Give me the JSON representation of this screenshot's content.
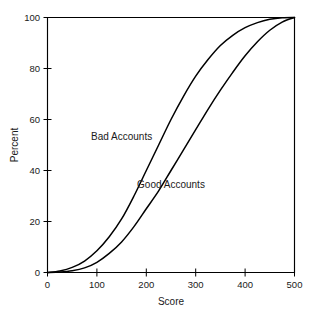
{
  "chart_data": {
    "type": "line",
    "title": "",
    "subtitle": "",
    "xlabel": "Score",
    "ylabel": "Percent",
    "xlim": [
      0,
      500
    ],
    "ylim": [
      0,
      100
    ],
    "xticks": [
      0,
      100,
      200,
      300,
      400,
      500
    ],
    "xtick_labels": [
      "0",
      "100",
      "200",
      "300",
      "400",
      "500"
    ],
    "yticks": [
      0,
      20,
      40,
      60,
      80,
      100
    ],
    "ytick_labels": [
      "0",
      "20",
      "40",
      "60",
      "80",
      "100"
    ],
    "grid": false,
    "legend_position": "inline-annotation",
    "line_color": "#000000",
    "background_color": "#ffffff",
    "axis_color": "#000000",
    "annotations": [
      {
        "text": "Bad Accounts",
        "x": 150,
        "y": 52
      },
      {
        "text": "Good Accounts",
        "x": 250,
        "y": 33
      }
    ],
    "x": [
      0,
      25,
      50,
      75,
      100,
      125,
      150,
      175,
      200,
      225,
      250,
      275,
      300,
      325,
      350,
      375,
      400,
      425,
      450,
      475,
      500
    ],
    "series": [
      {
        "name": "Bad Accounts",
        "values": [
          0,
          0.6,
          2,
          4.5,
          8.5,
          14,
          21,
          30,
          40,
          50,
          60,
          69,
          77,
          83.5,
          89,
          93,
          96,
          98,
          99.3,
          99.9,
          100
        ]
      },
      {
        "name": "Good Accounts",
        "values": [
          0,
          0.2,
          0.7,
          1.8,
          4,
          7.5,
          12,
          18,
          25,
          32,
          40,
          48,
          56,
          64,
          71.5,
          78.5,
          85,
          90.5,
          95,
          98.2,
          100
        ]
      }
    ]
  },
  "axes": {
    "ylabel": "Percent",
    "xlabel": "Score"
  }
}
